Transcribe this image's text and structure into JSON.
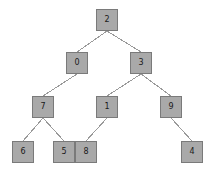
{
  "diagram": {
    "type": "binary-tree",
    "canvas": {
      "width": 213,
      "height": 172,
      "background": "#ffffff"
    },
    "style": {
      "node_fill": "#a9a9a9",
      "node_border": "#7a7a7a",
      "node_text": "#1a1a1a",
      "edge_color": "#9a9a9a",
      "node_size": 22,
      "edge_width": 1
    },
    "nodes": [
      {
        "id": "n2",
        "label": "2",
        "x": 96,
        "y": 9,
        "level": 0
      },
      {
        "id": "n0",
        "label": "0",
        "x": 66,
        "y": 52,
        "level": 1
      },
      {
        "id": "n3",
        "label": "3",
        "x": 130,
        "y": 52,
        "level": 1
      },
      {
        "id": "n7",
        "label": "7",
        "x": 32,
        "y": 96,
        "level": 2
      },
      {
        "id": "n1",
        "label": "1",
        "x": 96,
        "y": 96,
        "level": 2
      },
      {
        "id": "n9",
        "label": "9",
        "x": 160,
        "y": 96,
        "level": 2
      },
      {
        "id": "n6",
        "label": "6",
        "x": 12,
        "y": 141,
        "level": 3
      },
      {
        "id": "n5",
        "label": "5",
        "x": 53,
        "y": 141,
        "level": 3
      },
      {
        "id": "n8",
        "label": "8",
        "x": 75,
        "y": 141,
        "level": 3
      },
      {
        "id": "n4",
        "label": "4",
        "x": 181,
        "y": 141,
        "level": 3
      }
    ],
    "edges": [
      {
        "from": "n2",
        "to": "n0",
        "side": "left",
        "x1": 107,
        "y1": 31,
        "x2": 77,
        "y2": 52
      },
      {
        "from": "n2",
        "to": "n3",
        "side": "right",
        "x1": 107,
        "y1": 31,
        "x2": 141,
        "y2": 52
      },
      {
        "from": "n0",
        "to": "n7",
        "side": "left",
        "x1": 77,
        "y1": 74,
        "x2": 43,
        "y2": 96
      },
      {
        "from": "n3",
        "to": "n1",
        "side": "left",
        "x1": 141,
        "y1": 74,
        "x2": 107,
        "y2": 96
      },
      {
        "from": "n3",
        "to": "n9",
        "side": "right",
        "x1": 141,
        "y1": 74,
        "x2": 171,
        "y2": 96
      },
      {
        "from": "n7",
        "to": "n6",
        "side": "left",
        "x1": 43,
        "y1": 118,
        "x2": 23,
        "y2": 141
      },
      {
        "from": "n7",
        "to": "n5",
        "side": "right",
        "x1": 43,
        "y1": 118,
        "x2": 64,
        "y2": 141
      },
      {
        "from": "n1",
        "to": "n8",
        "side": "left",
        "x1": 107,
        "y1": 118,
        "x2": 86,
        "y2": 141
      },
      {
        "from": "n9",
        "to": "n4",
        "side": "right",
        "x1": 171,
        "y1": 118,
        "x2": 192,
        "y2": 141
      }
    ]
  }
}
